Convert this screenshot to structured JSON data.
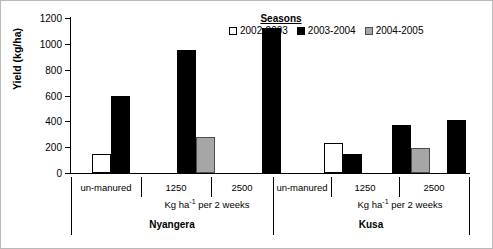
{
  "chart_data": {
    "type": "bar",
    "title": "",
    "xlabel": "",
    "ylabel": "Yield (kg/ha)",
    "ylim": [
      0,
      1200
    ],
    "ytick_labels": [
      "0",
      "200",
      "400",
      "600",
      "800",
      "1000",
      "1200"
    ],
    "ytick_values": [
      0,
      200,
      400,
      600,
      800,
      1000,
      1200
    ],
    "grid": false,
    "legend_title": "Seasons",
    "legend_position": "top-right",
    "series": [
      {
        "name": "2002-2003",
        "color": "#ffffff",
        "values": [
          150,
          null,
          null,
          235,
          null,
          null
        ]
      },
      {
        "name": "2003-2004",
        "color": "#000000",
        "values": [
          595,
          955,
          1120,
          145,
          375,
          410
        ]
      },
      {
        "name": "2004-2005",
        "color": "#a6a6a6",
        "values": [
          null,
          280,
          null,
          null,
          190,
          null
        ]
      }
    ],
    "categories": [
      "un-manured",
      "1250",
      "2500",
      "un-manured",
      "1250",
      "2500"
    ],
    "group_unit_label": "Kg ha-1 per 2 weeks",
    "sites": [
      "Nyangera",
      "Kusa"
    ]
  },
  "axis": {
    "y_title": "Yield (kg/ha)",
    "unit_prefix": "Kg ha",
    "unit_sup": "-1",
    "unit_suffix": " per 2 weeks"
  },
  "groups": [
    {
      "label": "un-manured"
    },
    {
      "label": "1250"
    },
    {
      "label": "2500"
    },
    {
      "label": "un-manured"
    },
    {
      "label": "1250"
    },
    {
      "label": "2500"
    }
  ],
  "sites": [
    {
      "label": "Nyangera"
    },
    {
      "label": "Kusa"
    }
  ],
  "legend": {
    "title": "Seasons",
    "items": [
      {
        "label": "2002-2003"
      },
      {
        "label": "2003-2004"
      },
      {
        "label": "2004-2005"
      }
    ]
  }
}
